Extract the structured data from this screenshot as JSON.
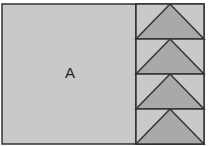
{
  "diagram": {
    "region_label": "A",
    "colors": {
      "fill": "#c9c9c9",
      "triangle_fill": "#a9a9a9",
      "stroke": "#333333"
    },
    "strip_rows": 4
  }
}
